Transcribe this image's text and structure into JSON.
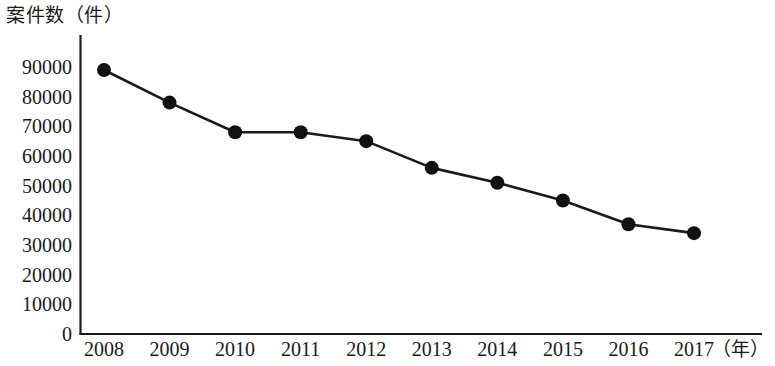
{
  "chart_data": {
    "type": "line",
    "title": "案件数（件）",
    "xlabel": "（年）",
    "ylabel": "案件数（件）",
    "categories": [
      "2008",
      "2009",
      "2010",
      "2011",
      "2012",
      "2013",
      "2014",
      "2015",
      "2016",
      "2017"
    ],
    "values": [
      89000,
      78000,
      68000,
      68000,
      65000,
      56000,
      51000,
      45000,
      37000,
      34000
    ],
    "series": [
      {
        "name": "案件数",
        "values": [
          89000,
          78000,
          68000,
          68000,
          65000,
          56000,
          51000,
          45000,
          37000,
          34000
        ]
      }
    ],
    "ylim": [
      0,
      90000
    ],
    "ytick_labels": [
      "90000",
      "80000",
      "70000",
      "60000",
      "50000",
      "40000",
      "30000",
      "20000",
      "10000",
      "0"
    ],
    "ytick_values": [
      90000,
      80000,
      70000,
      60000,
      50000,
      40000,
      30000,
      20000,
      10000,
      0
    ],
    "xtick_labels": [
      "2008",
      "2009",
      "2010",
      "2011",
      "2012",
      "2013",
      "2014",
      "2015",
      "2016",
      "2017"
    ],
    "x_unit_label": "（年）",
    "grid": false,
    "legend": false,
    "legend_position": "none",
    "line_color": "#1a1a1a",
    "marker_color": "#111111",
    "marker_shape": "circle",
    "background_color": "#ffffff",
    "axis_color": "#1a1a1a"
  }
}
